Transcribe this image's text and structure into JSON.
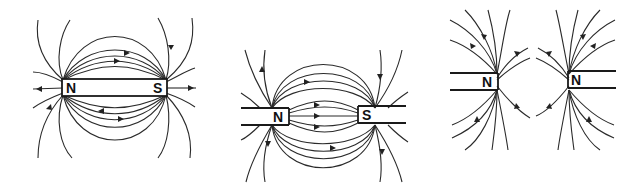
{
  "figure": {
    "panels": [
      {
        "id": "bar-magnet",
        "title": "Single bar magnet",
        "labels": {
          "left_pole": "N",
          "right_pole": "S"
        }
      },
      {
        "id": "unlike-poles",
        "title": "Unlike poles facing (attraction)",
        "labels": {
          "left_pole": "N",
          "right_pole": "S"
        }
      },
      {
        "id": "like-poles",
        "title": "Like poles facing (repulsion)",
        "labels": {
          "left_pole": "N",
          "right_pole": "N"
        }
      }
    ],
    "colors": {
      "line": "#2a2a2a",
      "background": "#ffffff"
    }
  }
}
